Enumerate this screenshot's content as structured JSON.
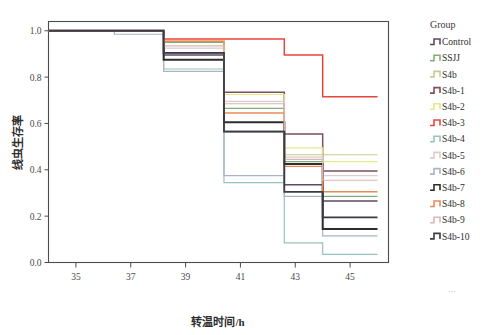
{
  "chart_data": {
    "type": "line",
    "title": "",
    "subtitle": "",
    "xlabel": "转温时间/h",
    "ylabel": "线虫生存率",
    "xlim": [
      34.0,
      46.4
    ],
    "ylim": [
      0.0,
      1.04
    ],
    "xticks": [
      35,
      37,
      39,
      41,
      43,
      45
    ],
    "xtick_labels": [
      "35",
      "37",
      "39",
      "41",
      "43",
      "45"
    ],
    "yticks": [
      0.0,
      0.2,
      0.4,
      0.6,
      0.8,
      1.0
    ],
    "ytick_labels": [
      "0.0",
      "0.2",
      "0.4",
      "0.6",
      "0.8",
      "1.0"
    ],
    "grid": false,
    "legend_position": "right",
    "legend_title": "Group",
    "step_style": "post",
    "x_breakpoints": [
      34.0,
      36.4,
      38.2,
      40.4,
      42.6,
      44.0,
      45.6,
      46.0
    ],
    "series": [
      {
        "name": "Control",
        "color": "#5e4a63",
        "width": 1.5,
        "x": [
          34.0,
          38.2,
          40.4,
          42.6,
          44.0,
          45.6
        ],
        "y": [
          1.0,
          0.895,
          0.565,
          0.335,
          0.265,
          0.265
        ]
      },
      {
        "name": "SSJJ",
        "color": "#7fae7a",
        "width": 1.2,
        "x": [
          34.0,
          38.2,
          40.4,
          42.6,
          44.0,
          45.6
        ],
        "y": [
          1.0,
          0.95,
          0.665,
          0.435,
          0.285,
          0.285
        ]
      },
      {
        "name": "S4b",
        "color": "#c6cc92",
        "width": 1.2,
        "x": [
          34.0,
          38.2,
          40.4,
          42.6,
          44.0,
          45.6
        ],
        "y": [
          1.0,
          0.955,
          0.725,
          0.465,
          0.465,
          0.465
        ]
      },
      {
        "name": "S4b-1",
        "color": "#7c4f5a",
        "width": 1.5,
        "x": [
          34.0,
          38.2,
          40.4,
          42.6,
          44.0,
          45.6
        ],
        "y": [
          1.0,
          0.905,
          0.735,
          0.555,
          0.395,
          0.395
        ]
      },
      {
        "name": "S4b-2",
        "color": "#e7e88a",
        "width": 1.2,
        "x": [
          34.0,
          38.2,
          40.4,
          42.6,
          44.0,
          45.6
        ],
        "y": [
          1.0,
          0.955,
          0.725,
          0.495,
          0.435,
          0.435
        ]
      },
      {
        "name": "S4b-3",
        "color": "#e8453c",
        "width": 1.5,
        "x": [
          34.0,
          38.2,
          40.4,
          42.6,
          44.0,
          46.0
        ],
        "y": [
          1.0,
          0.965,
          0.965,
          0.895,
          0.715,
          0.715
        ]
      },
      {
        "name": "S4b-4",
        "color": "#96c4bb",
        "width": 1.2,
        "x": [
          34.0,
          38.2,
          40.4,
          42.6,
          44.0,
          45.6
        ],
        "y": [
          1.0,
          0.835,
          0.345,
          0.085,
          0.035,
          0.035
        ]
      },
      {
        "name": "S4b-5",
        "color": "#ddcbd0",
        "width": 1.2,
        "x": [
          34.0,
          38.2,
          40.4,
          42.6,
          44.0,
          45.6
        ],
        "y": [
          1.0,
          0.925,
          0.695,
          0.455,
          0.375,
          0.375
        ]
      },
      {
        "name": "S4b-6",
        "color": "#aab4c2",
        "width": 1.2,
        "x": [
          34.0,
          36.4,
          38.2,
          40.4,
          42.6,
          44.0,
          45.6
        ],
        "y": [
          1.0,
          0.985,
          0.825,
          0.375,
          0.285,
          0.115,
          0.115
        ]
      },
      {
        "name": "S4b-7",
        "color": "#2d2d2d",
        "width": 2.0,
        "x": [
          34.0,
          38.2,
          40.4,
          42.6,
          44.0,
          45.6
        ],
        "y": [
          1.0,
          0.875,
          0.605,
          0.425,
          0.145,
          0.145
        ]
      },
      {
        "name": "S4b-8",
        "color": "#e98a55",
        "width": 1.4,
        "x": [
          34.0,
          38.2,
          40.4,
          42.6,
          44.0,
          45.6
        ],
        "y": [
          1.0,
          0.955,
          0.645,
          0.415,
          0.305,
          0.305
        ]
      },
      {
        "name": "S4b-9",
        "color": "#d8b7b5",
        "width": 1.2,
        "x": [
          34.0,
          38.2,
          40.4,
          42.6,
          44.0,
          45.6
        ],
        "y": [
          1.0,
          0.935,
          0.685,
          0.445,
          0.355,
          0.355
        ]
      },
      {
        "name": "S4b-10",
        "color": "#3b3a45",
        "width": 1.8,
        "x": [
          34.0,
          38.2,
          40.4,
          42.6,
          44.0,
          45.6
        ],
        "y": [
          1.0,
          0.905,
          0.565,
          0.305,
          0.195,
          0.195
        ]
      }
    ]
  },
  "legend": {
    "title": "Group",
    "items": [
      {
        "label": "Control",
        "color": "#5e4a63"
      },
      {
        "label": "SSJJ",
        "color": "#7fae7a"
      },
      {
        "label": "S4b",
        "color": "#c6cc92"
      },
      {
        "label": "S4b-1",
        "color": "#7c4f5a"
      },
      {
        "label": "S4b-2",
        "color": "#e7e88a"
      },
      {
        "label": "S4b-3",
        "color": "#e8453c"
      },
      {
        "label": "S4b-4",
        "color": "#96c4bb"
      },
      {
        "label": "S4b-5",
        "color": "#ddcbd0"
      },
      {
        "label": "S4b-6",
        "color": "#aab4c2"
      },
      {
        "label": "S4b-7",
        "color": "#2d2d2d"
      },
      {
        "label": "S4b-8",
        "color": "#e98a55"
      },
      {
        "label": "S4b-9",
        "color": "#d8b7b5"
      },
      {
        "label": "S4b-10",
        "color": "#3b3a45"
      }
    ]
  },
  "footer": {
    "ellipsis": "..."
  },
  "style": {
    "background": "#ffffff",
    "axis_color": "#4d4a52",
    "text_color": "#2e2e2e"
  }
}
